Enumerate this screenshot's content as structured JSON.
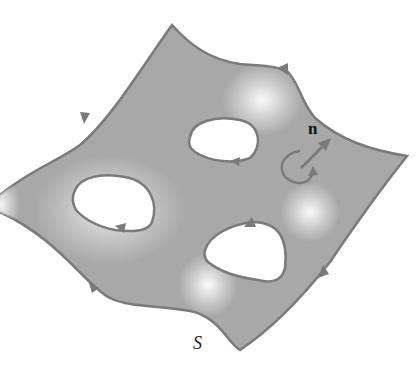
{
  "figure": {
    "labels": {
      "normal": "n",
      "surface": "S"
    },
    "colors": {
      "surface_fill": "#a9a9a9",
      "boundary_stroke": "#7a7a7a",
      "highlight": "#ffffff",
      "background": "#ffffff"
    },
    "holes": 3,
    "orientation": "boundary traversed so that surface lies to the left, consistent with normal n"
  }
}
